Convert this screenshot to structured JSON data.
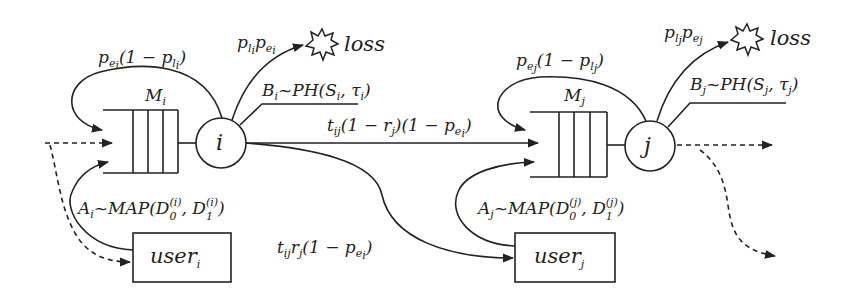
{
  "diagram": {
    "type": "queueing-network",
    "nodes": {
      "i": {
        "server_label": "i",
        "queue_label": "M",
        "queue_sub": "i",
        "self_loop": "p_{e_i}(1 − p_{l_i})",
        "loss_prob": "p_{l_i} p_{e_i}",
        "loss_label": "loss",
        "service": "B_i ~ PH(S_i, τ_i)",
        "arrival": "A_i ~ MAP(D_0^{(i)}, D_1^{(i)})",
        "user_label": "user",
        "user_sub": "i"
      },
      "j": {
        "server_label": "j",
        "queue_label": "M",
        "queue_sub": "j",
        "self_loop": "p_{e_j}(1 − p_{l_j})",
        "loss_prob": "p_{l_j} p_{e_j}",
        "loss_label": "loss",
        "service": "B_j ~ PH(S_j, τ_j)",
        "arrival": "A_j ~ MAP(D_0^{(j)}, D_1^{(j)})",
        "user_label": "user",
        "user_sub": "j"
      }
    },
    "edges": {
      "i_to_queue_j": "t_{ij}(1 − r_j)(1 − p_{e_i})",
      "i_to_user_j": "t_{ij} r_j (1 − p_{e_i})"
    },
    "text": {
      "loss": "loss",
      "user": "user",
      "M": "M",
      "i": "i",
      "j": "j",
      "p": "p",
      "B": "B",
      "A": "A",
      "t": "t",
      "one_minus": "(1 − ",
      "close": ")",
      "tilde_PH": "~PH(",
      "tilde_MAP": "~MAP(",
      "D": "D"
    }
  }
}
